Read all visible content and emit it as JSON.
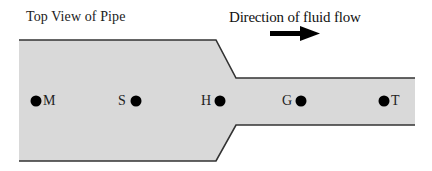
{
  "title": "Top View of Pipe",
  "flow": {
    "label": "Direction of fluid flow",
    "arrow_icon": "arrow-right-icon",
    "direction": "right"
  },
  "pipe": {
    "fill": "#d9d9d9",
    "outline": "#333333"
  },
  "points": [
    {
      "label": "M",
      "label_side": "right"
    },
    {
      "label": "S",
      "label_side": "left"
    },
    {
      "label": "H",
      "label_side": "left"
    },
    {
      "label": "G",
      "label_side": "left"
    },
    {
      "label": "T",
      "label_side": "right"
    }
  ]
}
